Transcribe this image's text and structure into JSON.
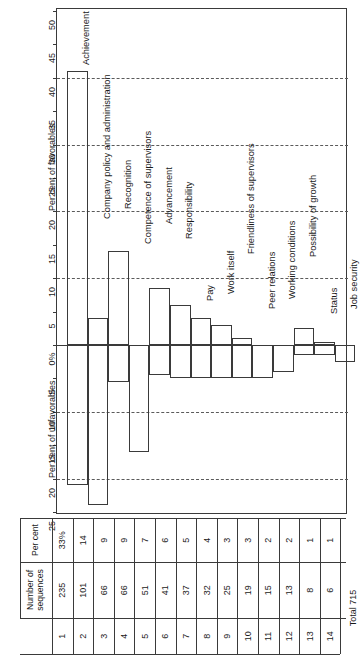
{
  "chart_data": {
    "type": "bar",
    "title": "",
    "orientation": "vertical-diverging",
    "xlabel": "",
    "ylabel_top": "Per cent of favorables",
    "ylabel_bottom": "Per cent of unfavorables",
    "favorable_axis": {
      "ticks": [
        50,
        45,
        40,
        35,
        30,
        25,
        20,
        15,
        10,
        5,
        0
      ],
      "zero_label": "0%"
    },
    "unfavorable_axis": {
      "ticks": [
        5,
        10,
        15,
        20,
        25
      ]
    },
    "gridlines_favorable": [
      40,
      30,
      20,
      10
    ],
    "gridlines_unfavorable": [
      10,
      20
    ],
    "categories": [
      "Achievement",
      "Recognition",
      "Work itself",
      "Responsibility",
      "Advancement",
      "Possibility of growth",
      "Company policy and administration",
      "Competence of supervisors",
      "Friendliness of supervisors",
      "Working conditions",
      "Peer relations",
      "Pay",
      "Status",
      "Job security"
    ],
    "column_order": [
      "Company policy and administration",
      "Recognition",
      "Competence of supervisors",
      "Advancement",
      "Responsibility",
      "Pay",
      "Work itself",
      "Friendliness of supervisors",
      "Peer relations",
      "Working conditions",
      "Possibility of growth",
      "Status",
      "Job security"
    ],
    "series": [
      {
        "name": "Per cent of favorables",
        "values": [
          41,
          4,
          14,
          0,
          8.5,
          6,
          4,
          3,
          1,
          0,
          0,
          2.5,
          0.5,
          0
        ]
      },
      {
        "name": "Per cent of unfavorables",
        "values": [
          21,
          24,
          5.5,
          16,
          4.5,
          5,
          4.5,
          4.5,
          4.5,
          4.5,
          3,
          1.5,
          1.5,
          2.5
        ]
      }
    ],
    "bars": [
      {
        "label": "Achievement",
        "favorable": 41,
        "unfavorable": 21
      },
      {
        "label": "Company policy and administration",
        "favorable": 4,
        "unfavorable": 24
      },
      {
        "label": "Recognition",
        "favorable": 14,
        "unfavorable": 5.5
      },
      {
        "label": "Competence of supervisors",
        "favorable": 0,
        "unfavorable": 16
      },
      {
        "label": "Advancement",
        "favorable": 8.5,
        "unfavorable": 4.5
      },
      {
        "label": "Responsibility",
        "favorable": 6,
        "unfavorable": 5
      },
      {
        "label": "Pay",
        "favorable": 4,
        "unfavorable": 5
      },
      {
        "label": "Work itself",
        "favorable": 3,
        "unfavorable": 5
      },
      {
        "label": "Friendliness of supervisors",
        "favorable": 1,
        "unfavorable": 5
      },
      {
        "label": "Peer relations",
        "favorable": 0,
        "unfavorable": 5
      },
      {
        "label": "Working conditions",
        "favorable": 0,
        "unfavorable": 4
      },
      {
        "label": "Possibility of growth",
        "favorable": 2.5,
        "unfavorable": 1.5
      },
      {
        "label": "Status",
        "favorable": 0.5,
        "unfavorable": 1.5
      },
      {
        "label": "Job security",
        "favorable": 0,
        "unfavorable": 2.5
      }
    ]
  },
  "plot": {
    "favorable_axis_title": "Per cent of favorables",
    "unfavorable_axis_title": "Per cent of unfavorables",
    "zero_tick_label": "0%",
    "fav_ticks": [
      "50",
      "45",
      "40",
      "35",
      "30",
      "25",
      "20",
      "15",
      "10",
      "5"
    ],
    "unfav_ticks": [
      "5",
      "10",
      "15",
      "20",
      "25"
    ],
    "factor_labels": [
      "Achievement",
      "Company policy and administration",
      "Recognition",
      "Competence of supervisors",
      "Advancement",
      "Responsibility",
      "Pay",
      "Work itself",
      "Friendliness of supervisors",
      "Peer relations",
      "Working conditions",
      "Possibility of growth",
      "Status",
      "Job security"
    ]
  },
  "table": {
    "headers": {
      "index": "",
      "count": "Number of sequences",
      "percent": "Per cent"
    },
    "rows": [
      {
        "index": "1",
        "count": "235",
        "percent": "33%"
      },
      {
        "index": "2",
        "count": "101",
        "percent": "14"
      },
      {
        "index": "3",
        "count": "66",
        "percent": "9"
      },
      {
        "index": "4",
        "count": "66",
        "percent": "9"
      },
      {
        "index": "5",
        "count": "51",
        "percent": "7"
      },
      {
        "index": "6",
        "count": "41",
        "percent": "6"
      },
      {
        "index": "7",
        "count": "37",
        "percent": "5"
      },
      {
        "index": "8",
        "count": "32",
        "percent": "4"
      },
      {
        "index": "9",
        "count": "25",
        "percent": "3"
      },
      {
        "index": "10",
        "count": "19",
        "percent": "3"
      },
      {
        "index": "11",
        "count": "15",
        "percent": "2"
      },
      {
        "index": "12",
        "count": "13",
        "percent": "2"
      },
      {
        "index": "13",
        "count": "8",
        "percent": "1"
      },
      {
        "index": "14",
        "count": "6",
        "percent": "1"
      }
    ],
    "total_label": "Total 715"
  }
}
